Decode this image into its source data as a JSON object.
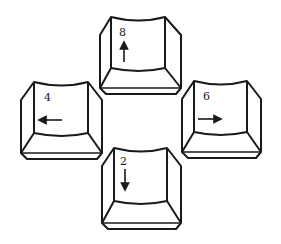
{
  "diagram": {
    "title": "",
    "keys": [
      {
        "id": "up",
        "label": "8",
        "arrow": "up",
        "position": "top"
      },
      {
        "id": "left",
        "label": "4",
        "arrow": "left",
        "position": "left"
      },
      {
        "id": "right",
        "label": "6",
        "arrow": "right",
        "position": "right"
      },
      {
        "id": "down",
        "label": "2",
        "arrow": "down",
        "position": "bottom"
      }
    ],
    "stroke_color": "#1a1a1a",
    "background": "#ffffff"
  }
}
